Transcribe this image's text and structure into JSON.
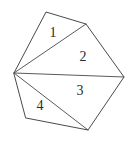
{
  "figure": {
    "kind": "polygon-triangulation-diagram",
    "background_color": "#ffffff",
    "stroke_color": "#4a4a4a",
    "label_color": "#2b2b2b",
    "canvas": {
      "width": 130,
      "height": 151
    },
    "vertices": [
      {
        "name": "left-hub",
        "x": 14,
        "y": 73
      },
      {
        "name": "top",
        "x": 46,
        "y": 12
      },
      {
        "name": "upper-right",
        "x": 86,
        "y": 24
      },
      {
        "name": "right",
        "x": 124,
        "y": 77
      },
      {
        "name": "bottom",
        "x": 88,
        "y": 130
      },
      {
        "name": "bottom-left",
        "x": 26,
        "y": 118
      }
    ],
    "outline_path": "M 14 73 L 46 12 L 86 24 L 124 77 L 88 130 L 26 118 Z",
    "diagonals": [
      {
        "name": "hub-to-upper-right",
        "path": "M 14 73 L 86 24"
      },
      {
        "name": "hub-to-right",
        "path": "M 14 73 L 124 77"
      },
      {
        "name": "hub-to-bottom",
        "path": "M 14 73 L 88 130"
      }
    ],
    "regions": [
      {
        "label": "1",
        "cx": 53,
        "cy": 33,
        "path": "M 14 73 L 46 12 L 86 24 Z"
      },
      {
        "label": "2",
        "cx": 83,
        "cy": 57,
        "path": "M 14 73 L 86 24 L 124 77 Z"
      },
      {
        "label": "3",
        "cx": 80,
        "cy": 91,
        "path": "M 14 73 L 124 77 L 88 130 Z"
      },
      {
        "label": "4",
        "cx": 40,
        "cy": 106,
        "path": "M 14 73 L 88 130 L 26 118 Z"
      }
    ]
  }
}
